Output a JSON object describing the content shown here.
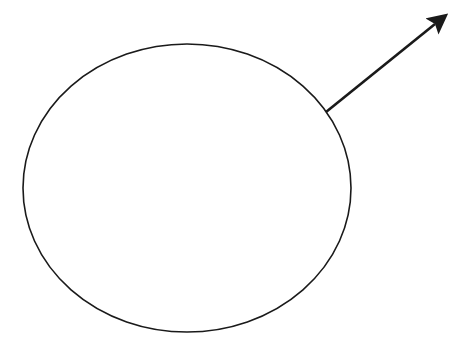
{
  "diagram": {
    "background": "#ffffff",
    "stroke_color": "#1a1a1a",
    "ellipse": {
      "cx": 187,
      "cy": 188,
      "rx": 164,
      "ry": 144,
      "stroke_width": 1.6,
      "fill": "none"
    },
    "arrow": {
      "x1": 326,
      "y1": 112,
      "x2": 435,
      "y2": 24,
      "tip_x": 443,
      "tip_y": 17,
      "stroke_width": 2.6,
      "head": "filled-triangle"
    }
  }
}
